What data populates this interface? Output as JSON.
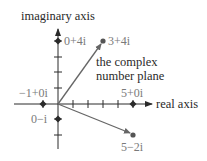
{
  "diagram": {
    "title": "the complex number plane",
    "caption_line1": "the complex",
    "caption_line2": "number plane",
    "axes": {
      "x_label": "real axis",
      "y_label": "imaginary axis"
    },
    "points": [
      {
        "id": "p-0+4i",
        "label": "0+4i",
        "re": 0,
        "im": 4,
        "marker": "diamond"
      },
      {
        "id": "p-3+4i",
        "label": "3+4i",
        "re": 3,
        "im": 4,
        "marker": "circle",
        "vector": true
      },
      {
        "id": "p--1+0i",
        "label": "−1+0i",
        "re": -1,
        "im": 0,
        "marker": "diamond"
      },
      {
        "id": "p-5+0i",
        "label": "5+0i",
        "re": 5,
        "im": 0,
        "marker": "diamond"
      },
      {
        "id": "p-0-i",
        "label": "0−i",
        "re": 0,
        "im": -1,
        "marker": "diamond"
      },
      {
        "id": "p-5-2i",
        "label": "5−2i",
        "re": 5,
        "im": -2,
        "marker": "circle",
        "vector": true
      }
    ],
    "colors": {
      "axis": "#2a2a2a",
      "vector": "#666666",
      "label": "#7a7a7a"
    }
  }
}
